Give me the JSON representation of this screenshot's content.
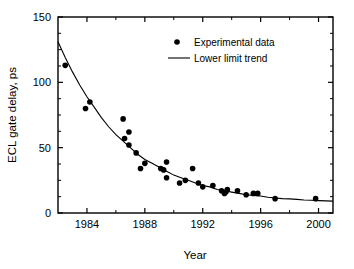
{
  "chart_data": {
    "type": "scatter",
    "title": "",
    "xlabel": "Year",
    "ylabel": "ECL gate delay, ps",
    "xlim": [
      1982,
      2001
    ],
    "ylim": [
      0,
      150
    ],
    "xticks": [
      1984,
      1988,
      1992,
      1996,
      2000
    ],
    "xticklabels": [
      "1984",
      "1988",
      "1992",
      "1996",
      "2000"
    ],
    "xminorticks": [
      1986,
      1990,
      1994,
      1998
    ],
    "yticks": [
      0,
      50,
      100,
      150
    ],
    "yticklabels": [
      "0",
      "50",
      "100",
      "150"
    ],
    "yminorticks": [
      12.5,
      25,
      37.5,
      62.5,
      75,
      87.5,
      112.5,
      125,
      137.5
    ],
    "grid": false,
    "legend_position": "upper center",
    "series": [
      {
        "name": "Experimental data",
        "type": "scatter",
        "marker": "circle",
        "color": "#000000",
        "points": [
          [
            1982.5,
            113
          ],
          [
            1983.9,
            80
          ],
          [
            1984.2,
            85
          ],
          [
            1986.5,
            72
          ],
          [
            1986.6,
            57
          ],
          [
            1986.9,
            62
          ],
          [
            1986.9,
            52
          ],
          [
            1987.4,
            46
          ],
          [
            1987.7,
            34
          ],
          [
            1988.0,
            38
          ],
          [
            1989.1,
            34
          ],
          [
            1989.3,
            33
          ],
          [
            1989.5,
            39
          ],
          [
            1989.5,
            27
          ],
          [
            1990.4,
            23
          ],
          [
            1990.8,
            25
          ],
          [
            1991.3,
            34
          ],
          [
            1991.7,
            23
          ],
          [
            1992.0,
            20
          ],
          [
            1992.7,
            21
          ],
          [
            1993.3,
            17
          ],
          [
            1993.5,
            15
          ],
          [
            1993.6,
            16
          ],
          [
            1993.7,
            18
          ],
          [
            1994.4,
            17
          ],
          [
            1995.0,
            14
          ],
          [
            1995.5,
            15
          ],
          [
            1995.8,
            15
          ],
          [
            1997.0,
            11
          ],
          [
            1999.8,
            11
          ]
        ]
      },
      {
        "name": "Lower limit trend",
        "type": "line",
        "color": "#000000",
        "description": "exponential decay toward asymptote near 9 ps",
        "points": [
          [
            1982.0,
            131
          ],
          [
            1982.5,
            119
          ],
          [
            1983.0,
            108
          ],
          [
            1983.5,
            98
          ],
          [
            1984.0,
            89
          ],
          [
            1984.5,
            81
          ],
          [
            1985.0,
            73
          ],
          [
            1985.5,
            66
          ],
          [
            1986.0,
            60
          ],
          [
            1986.5,
            55
          ],
          [
            1987.0,
            50
          ],
          [
            1987.5,
            45
          ],
          [
            1988.0,
            41
          ],
          [
            1988.5,
            38
          ],
          [
            1989.0,
            35
          ],
          [
            1989.5,
            32
          ],
          [
            1990.0,
            29
          ],
          [
            1990.5,
            27
          ],
          [
            1991.0,
            25
          ],
          [
            1991.5,
            23
          ],
          [
            1992.0,
            21
          ],
          [
            1992.5,
            20
          ],
          [
            1993.0,
            18
          ],
          [
            1993.5,
            17
          ],
          [
            1994.0,
            16
          ],
          [
            1994.5,
            15
          ],
          [
            1995.0,
            14
          ],
          [
            1995.5,
            13.5
          ],
          [
            1996.0,
            13
          ],
          [
            1996.5,
            12
          ],
          [
            1997.0,
            11.5
          ],
          [
            1997.5,
            11
          ],
          [
            1998.0,
            10.8
          ],
          [
            1998.5,
            10.4
          ],
          [
            1999.0,
            10
          ],
          [
            1999.5,
            9.8
          ],
          [
            2000.0,
            9.5
          ],
          [
            2000.5,
            9.3
          ],
          [
            2001.0,
            9.1
          ]
        ]
      }
    ]
  },
  "legend": {
    "entries": [
      {
        "label": "Experimental data",
        "marker": "dot"
      },
      {
        "label": "Lower limit trend",
        "marker": "line"
      }
    ]
  },
  "axes": {
    "x_title": "Year",
    "y_title": "ECL gate delay, ps"
  }
}
